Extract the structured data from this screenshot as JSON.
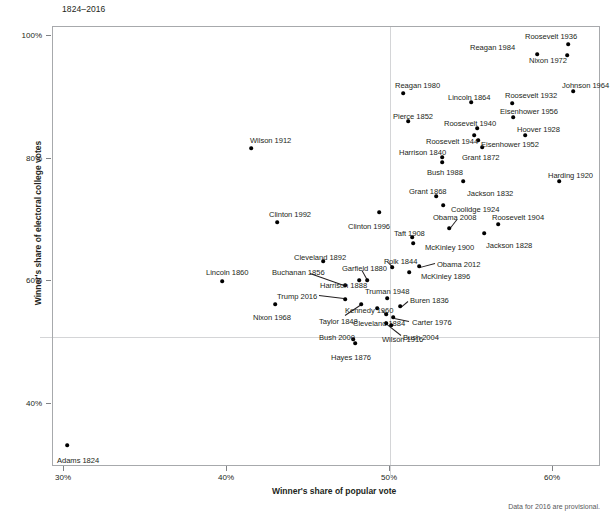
{
  "chart_title": "1824–2016",
  "footnote": "Data for 2016 are provisional.",
  "axes": {
    "xlabel": "Winner's share of popular vote",
    "ylabel": "Winner's share of electoral college votes",
    "xticks": [
      "30%",
      "40%",
      "50%",
      "60%"
    ],
    "yticks": [
      "100%",
      "80%",
      "60%",
      "40%"
    ]
  },
  "chart_data": {
    "type": "scatter",
    "title": "1824–2016",
    "xlabel": "Winner's share of popular vote",
    "ylabel": "Winner's share of electoral college votes",
    "xlim": [
      28.0,
      62.7
    ],
    "ylim": [
      31.5,
      101.5
    ],
    "xticks": [
      30,
      40,
      50,
      60
    ],
    "yticks": [
      40,
      60,
      80,
      100
    ],
    "grid": false,
    "reference_lines": {
      "x": 50,
      "y": 50
    },
    "annotation": "Data for 2016 are provisional.",
    "points": [
      {
        "label": "Adams 1824",
        "x": 30.9,
        "y": 32.2
      },
      {
        "label": "Jackson 1828",
        "x": 56.0,
        "y": 68.2
      },
      {
        "label": "Jackson 1832",
        "x": 54.2,
        "y": 76.6
      },
      {
        "label": "Buren 1836",
        "x": 50.8,
        "y": 57.8
      },
      {
        "label": "Harrison 1840",
        "x": 52.9,
        "y": 79.6
      },
      {
        "label": "Polk 1844",
        "x": 49.5,
        "y": 61.8
      },
      {
        "label": "Taylor 1848",
        "x": 47.3,
        "y": 56.2
      },
      {
        "label": "Pierce 1852",
        "x": 50.8,
        "y": 85.8
      },
      {
        "label": "Buchanan 1856",
        "x": 45.3,
        "y": 58.8
      },
      {
        "label": "Lincoln 1860",
        "x": 39.7,
        "y": 59.4
      },
      {
        "label": "Lincoln 1864",
        "x": 55.0,
        "y": 91.0
      },
      {
        "label": "Grant 1868",
        "x": 52.7,
        "y": 72.8
      },
      {
        "label": "Grant 1872",
        "x": 55.6,
        "y": 81.9
      },
      {
        "label": "Hayes 1876",
        "x": 47.9,
        "y": 50.1
      },
      {
        "label": "Garfield 1880",
        "x": 48.3,
        "y": 58.0
      },
      {
        "label": "Cleveland 1884",
        "x": 48.9,
        "y": 54.6
      },
      {
        "label": "Harrison 1888",
        "x": 47.8,
        "y": 58.1
      },
      {
        "label": "Cleveland 1892",
        "x": 46.0,
        "y": 62.4
      },
      {
        "label": "McKinley 1896",
        "x": 51.0,
        "y": 60.6
      },
      {
        "label": "McKinley 1900",
        "x": 51.6,
        "y": 65.3
      },
      {
        "label": "Roosevelt 1904",
        "x": 56.4,
        "y": 70.6
      },
      {
        "label": "Taft 1908",
        "x": 51.6,
        "y": 66.5
      },
      {
        "label": "Wilson 1912",
        "x": 41.8,
        "y": 81.9
      },
      {
        "label": "Wilson 1916",
        "x": 49.2,
        "y": 52.2
      },
      {
        "label": "Harding 1920",
        "x": 60.3,
        "y": 76.1
      },
      {
        "label": "Coolidge 1924",
        "x": 54.0,
        "y": 71.9
      },
      {
        "label": "Hoover 1928",
        "x": 58.2,
        "y": 83.6
      },
      {
        "label": "Roosevelt 1932",
        "x": 57.4,
        "y": 88.9
      },
      {
        "label": "Roosevelt 1936",
        "x": 60.8,
        "y": 98.5
      },
      {
        "label": "Roosevelt 1940",
        "x": 54.7,
        "y": 84.6
      },
      {
        "label": "Roosevelt 1944",
        "x": 53.4,
        "y": 81.4
      },
      {
        "label": "Truman 1948",
        "x": 49.6,
        "y": 57.1
      },
      {
        "label": "Eisenhower 1952",
        "x": 55.2,
        "y": 83.2
      },
      {
        "label": "Eisenhower 1956",
        "x": 57.4,
        "y": 86.1
      },
      {
        "label": "Kennedy 1960",
        "x": 49.7,
        "y": 56.4
      },
      {
        "label": "Johnson 1964",
        "x": 61.1,
        "y": 90.3
      },
      {
        "label": "Nixon 1968",
        "x": 43.4,
        "y": 55.9
      },
      {
        "label": "Nixon 1972",
        "x": 60.7,
        "y": 96.7
      },
      {
        "label": "Carter 1976",
        "x": 50.1,
        "y": 55.2
      },
      {
        "label": "Reagan 1980",
        "x": 50.7,
        "y": 90.9
      },
      {
        "label": "Reagan 1984",
        "x": 58.8,
        "y": 97.6
      },
      {
        "label": "Bush 1988",
        "x": 53.4,
        "y": 79.2
      },
      {
        "label": "Clinton 1992",
        "x": 43.0,
        "y": 68.8
      },
      {
        "label": "Clinton 1996",
        "x": 49.2,
        "y": 70.4
      },
      {
        "label": "Bush 2000",
        "x": 47.9,
        "y": 50.4
      },
      {
        "label": "Bush 2004",
        "x": 50.7,
        "y": 53.2
      },
      {
        "label": "Obama 2008",
        "x": 52.9,
        "y": 67.8
      },
      {
        "label": "Obama 2012",
        "x": 51.1,
        "y": 61.7
      },
      {
        "label": "Trump 2016",
        "x": 46.4,
        "y": 56.9
      }
    ]
  },
  "labels": [
    {
      "name": "Adams 1824",
      "lx": 56,
      "ly": 455,
      "px": 66,
      "py": 444
    },
    {
      "name": "Jackson 1828",
      "lx": 485,
      "ly": 240,
      "px": 483,
      "py": 232,
      "leader": null
    },
    {
      "name": "Jackson 1832",
      "lx": 466,
      "ly": 188,
      "px": 462,
      "py": 180
    },
    {
      "name": "Buren 1836",
      "lx": 409,
      "ly": 295,
      "px": 399,
      "py": 305,
      "leader": {
        "x1": 407,
        "y1": 300,
        "x2": 401,
        "y2": 305
      }
    },
    {
      "name": "Harrison 1840",
      "lx": 398,
      "ly": 147,
      "px": 441,
      "py": 156
    },
    {
      "name": "Polk 1844",
      "lx": 383,
      "ly": 256,
      "px": 391,
      "py": 266,
      "leader": {
        "x1": 386,
        "y1": 260,
        "x2": 391,
        "y2": 265
      }
    },
    {
      "name": "Taylor 1848",
      "lx": 318,
      "ly": 316,
      "px": 360,
      "py": 303,
      "leader": {
        "x1": 344,
        "y1": 314,
        "x2": 359,
        "y2": 304
      }
    },
    {
      "name": "Pierce 1852",
      "lx": 392,
      "ly": 111,
      "px": 407,
      "py": 120
    },
    {
      "name": "Buchanan 1856",
      "lx": 271,
      "ly": 267,
      "px": 344,
      "py": 284,
      "leader": {
        "x1": 309,
        "y1": 272,
        "x2": 343,
        "y2": 284
      }
    },
    {
      "name": "Lincoln 1860",
      "lx": 205,
      "ly": 267,
      "px": 221,
      "py": 280
    },
    {
      "name": "Lincoln 1864",
      "lx": 447,
      "ly": 92,
      "px": 470,
      "py": 101
    },
    {
      "name": "Grant 1868",
      "lx": 408,
      "ly": 186,
      "px": 435,
      "py": 195
    },
    {
      "name": "Grant 1872",
      "lx": 461,
      "ly": 152,
      "px": 481,
      "py": 146
    },
    {
      "name": "Hayes 1876",
      "lx": 330,
      "ly": 352,
      "px": 354,
      "py": 342
    },
    {
      "name": "Garfield 1880",
      "lx": 341,
      "ly": 263,
      "px": 366,
      "py": 279,
      "leader": {
        "x1": 361,
        "y1": 269,
        "x2": 366,
        "y2": 278
      }
    },
    {
      "name": "Cleveland 1884",
      "lx": 352,
      "ly": 318,
      "px": 376,
      "py": 307
    },
    {
      "name": "Harrison 1888",
      "lx": 319,
      "ly": 280,
      "px": 358,
      "py": 279
    },
    {
      "name": "Cleveland 1892",
      "lx": 293,
      "ly": 252,
      "px": 322,
      "py": 260
    },
    {
      "name": "McKinley 1896",
      "lx": 420,
      "ly": 271,
      "px": 408,
      "py": 271
    },
    {
      "name": "McKinley 1900",
      "lx": 424,
      "ly": 242,
      "px": 412,
      "py": 242
    },
    {
      "name": "Roosevelt 1904",
      "lx": 491,
      "ly": 212,
      "px": 497,
      "py": 223
    },
    {
      "name": "Taft 1908",
      "lx": 393,
      "ly": 228,
      "px": 411,
      "py": 236
    },
    {
      "name": "Wilson 1912",
      "lx": 249,
      "ly": 135,
      "px": 250,
      "py": 147
    },
    {
      "name": "Wilson 1916",
      "lx": 381,
      "ly": 334,
      "px": 390,
      "py": 324
    },
    {
      "name": "Harding 1920",
      "lx": 547,
      "ly": 170,
      "px": 558,
      "py": 180
    },
    {
      "name": "Coolidge 1924",
      "lx": 450,
      "ly": 204,
      "px": 442,
      "py": 204
    },
    {
      "name": "Hoover 1928",
      "lx": 516,
      "ly": 124,
      "px": 524,
      "py": 134
    },
    {
      "name": "Roosevelt 1932",
      "lx": 504,
      "ly": 90,
      "px": 511,
      "py": 102
    },
    {
      "name": "Roosevelt 1936",
      "lx": 524,
      "ly": 31,
      "px": 567,
      "py": 43
    },
    {
      "name": "Roosevelt 1940",
      "lx": 443,
      "ly": 118,
      "px": 476,
      "py": 127
    },
    {
      "name": "Roosevelt 1944",
      "lx": 425,
      "ly": 136,
      "px": 477,
      "py": 139
    },
    {
      "name": "Truman 1948",
      "lx": 364,
      "ly": 286,
      "px": 386,
      "py": 297
    },
    {
      "name": "Eisenhower 1952",
      "lx": 480,
      "ly": 139,
      "px": 473,
      "py": 134
    },
    {
      "name": "Eisenhower 1956",
      "lx": 499,
      "ly": 106,
      "px": 512,
      "py": 116
    },
    {
      "name": "Kennedy 1960",
      "lx": 344,
      "ly": 305,
      "px": 385,
      "py": 313,
      "leader": {
        "x1": 381,
        "y1": 309,
        "x2": 385,
        "y2": 313
      }
    },
    {
      "name": "Johnson 1964",
      "lx": 561,
      "ly": 80,
      "px": 572,
      "py": 90
    },
    {
      "name": "Nixon 1968",
      "lx": 252,
      "ly": 312,
      "px": 274,
      "py": 303
    },
    {
      "name": "Nixon 1972",
      "lx": 528,
      "ly": 55,
      "px": 566,
      "py": 54
    },
    {
      "name": "Carter 1976",
      "lx": 411,
      "ly": 317,
      "px": 392,
      "py": 316,
      "leader": {
        "x1": 408,
        "y1": 320,
        "x2": 393,
        "y2": 317
      }
    },
    {
      "name": "Reagan 1980",
      "lx": 394,
      "ly": 80,
      "px": 402,
      "py": 92
    },
    {
      "name": "Reagan 1984",
      "lx": 469,
      "ly": 42,
      "px": 536,
      "py": 53
    },
    {
      "name": "Bush 1988",
      "lx": 426,
      "ly": 167,
      "px": 441,
      "py": 161
    },
    {
      "name": "Clinton 1992",
      "lx": 268,
      "ly": 209,
      "px": 276,
      "py": 221
    },
    {
      "name": "Clinton 1996",
      "lx": 347,
      "ly": 221,
      "px": 378,
      "py": 211
    },
    {
      "name": "Bush 2000",
      "lx": 318,
      "ly": 332,
      "px": 352,
      "py": 338
    },
    {
      "name": "Bush 2004",
      "lx": 402,
      "ly": 332,
      "px": 385,
      "py": 322,
      "leader": {
        "x1": 400,
        "y1": 334,
        "x2": 386,
        "y2": 323
      }
    },
    {
      "name": "Obama 2008",
      "lx": 432,
      "ly": 212,
      "px": 448,
      "py": 227,
      "leader": {
        "x1": 456,
        "y1": 218,
        "x2": 449,
        "y2": 227
      }
    },
    {
      "name": "Obama 2012",
      "lx": 436,
      "ly": 259,
      "px": 418,
      "py": 265,
      "leader": {
        "x1": 434,
        "y1": 262,
        "x2": 419,
        "y2": 266
      }
    },
    {
      "name": "Trump 2016",
      "lx": 276,
      "ly": 291,
      "px": 344,
      "py": 298,
      "leader": {
        "x1": 318,
        "y1": 294,
        "x2": 343,
        "y2": 297
      }
    }
  ]
}
